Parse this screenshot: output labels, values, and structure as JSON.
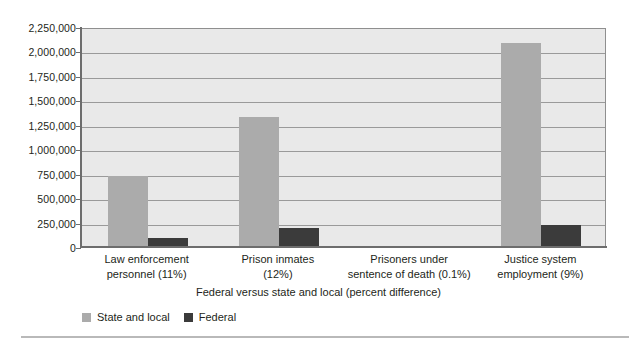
{
  "chart_data": {
    "type": "bar",
    "title": "",
    "xlabel": "Federal versus state and local (percent difference)",
    "ylabel": "",
    "categories": [
      "Law enforcement personnel (11%)",
      "Prison inmates (12%)",
      "Prisoners under sentence of death (0.1%)",
      "Justice system employment (9%)"
    ],
    "category_lines": [
      [
        "Law enforcement",
        "personnel (11%)"
      ],
      [
        "Prison inmates",
        "(12%)"
      ],
      [
        "Prisoners under",
        "sentence of death (0.1%)"
      ],
      [
        "Justice system",
        "employment (9%)"
      ]
    ],
    "series": [
      {
        "name": "State and local",
        "color": "#ababab",
        "values": [
          725000,
          1330000,
          0,
          2090000
        ]
      },
      {
        "name": "Federal",
        "color": "#3b3b3b",
        "values": [
          88000,
          190000,
          0,
          230000
        ]
      }
    ],
    "ylim": [
      0,
      2250000
    ],
    "yticks": [
      0,
      250000,
      500000,
      750000,
      1000000,
      1250000,
      1500000,
      1750000,
      2000000,
      2250000
    ],
    "ytick_labels": [
      "0",
      "250,000",
      "500,000",
      "750,000",
      "1,000,000",
      "1,250,000",
      "1,500,000",
      "1,750,000",
      "2,000,000",
      "2,250,000"
    ],
    "grid": true,
    "legend_position": "bottom-left",
    "plot_background": "#e9e9e9",
    "grid_color": "#9a9a9a",
    "axis_color": "#6d6d6d"
  },
  "legend": {
    "entries": [
      {
        "label": "State and local",
        "color": "#ababab"
      },
      {
        "label": "Federal",
        "color": "#3b3b3b"
      }
    ]
  }
}
